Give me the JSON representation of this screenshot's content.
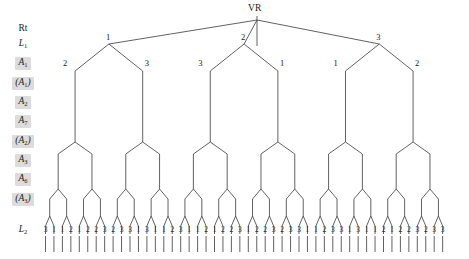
{
  "diagram": {
    "title_node": "VR",
    "row_labels": [
      {
        "text": "Rt",
        "style": "plain",
        "y": 28
      },
      {
        "text": "L",
        "sub": "1",
        "style": "italic",
        "y": 43
      },
      {
        "text": "A",
        "sub": "1",
        "style": "shaded",
        "y": 62
      },
      {
        "text": "(A",
        "sub": "1",
        "suffix": ")",
        "style": "shaded",
        "y": 82
      },
      {
        "text": "A",
        "sub": "2",
        "style": "shaded",
        "y": 101
      },
      {
        "text": "A",
        "sub": "7",
        "style": "shaded",
        "y": 120
      },
      {
        "text": "(A",
        "sub": "2",
        "suffix": ")",
        "style": "shaded",
        "y": 140
      },
      {
        "text": "A",
        "sub": "3",
        "style": "shaded",
        "y": 159
      },
      {
        "text": "A",
        "sub": "6",
        "style": "shaded",
        "y": 178
      },
      {
        "text": "(A",
        "sub": "3",
        "suffix": ")",
        "style": "shaded",
        "y": 198
      },
      {
        "text": "L",
        "sub": "2",
        "style": "italic",
        "y": 229
      }
    ],
    "level1_labels": [
      "1",
      "2",
      "3"
    ],
    "level2_labels": [
      "2",
      "3",
      "3",
      "1",
      "1",
      "2"
    ],
    "leaf_labels": [
      "3",
      "1",
      "1",
      "2",
      "1",
      "2",
      "2",
      "3",
      "2",
      "3",
      "3",
      "1",
      "3",
      "1",
      "1",
      "2",
      "3",
      "1",
      "1",
      "2",
      "1",
      "2",
      "2",
      "3",
      "1",
      "2",
      "2",
      "3",
      "2",
      "3",
      "3",
      "1",
      "1",
      "2",
      "3",
      "3",
      "1",
      "3",
      "1",
      "1",
      "2",
      "1",
      "2",
      "2",
      "3",
      "2",
      "3",
      "3"
    ],
    "colors": {
      "line": "#3a3a3a",
      "label_chip": "#dcdcdc",
      "text": "#1a1a1a",
      "background": "#ffffff"
    },
    "geometry": {
      "root_x": 257,
      "root_y": 16,
      "level1_y": 44,
      "level2_y": 63,
      "leaf_y": 222,
      "tick_bottom": 252,
      "leaf_start_x": 45.5,
      "leaf_spacing": 8.45
    }
  }
}
